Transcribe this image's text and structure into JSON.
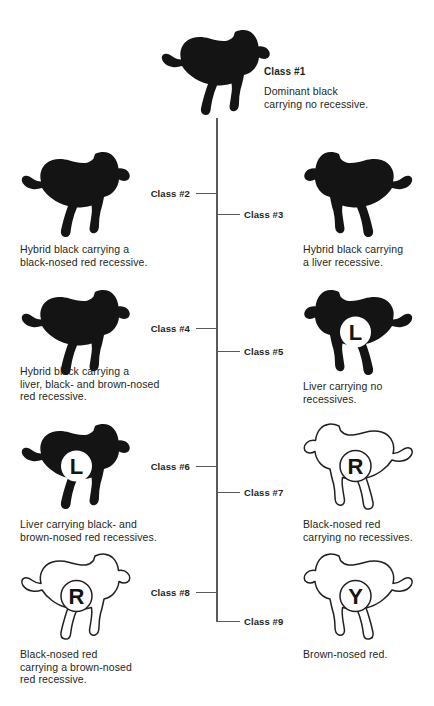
{
  "diagram": {
    "line_color": "#58595b",
    "silhouette_color": "#141414",
    "outline_color": "#231f20",
    "text_color": "#231f20"
  },
  "nodes": [
    {
      "id": "class1",
      "label": "Class #1",
      "caption": "Dominant black carrying no recessive.",
      "caption_lines": [
        "Dominant black",
        "carrying no recessive."
      ],
      "dog_style": "filled",
      "dog_facing": "right",
      "badge": null
    },
    {
      "id": "class2",
      "label": "Class #2",
      "caption": "Hybrid black carrying a black-nosed red recessive.",
      "caption_lines": [
        "Hybrid black carrying a",
        "black-nosed red recessive."
      ],
      "dog_style": "filled",
      "dog_facing": "right",
      "badge": null
    },
    {
      "id": "class3",
      "label": "Class #3",
      "caption": "Hybrid black carrying a liver recessive.",
      "caption_lines": [
        "Hybrid black carrying",
        "a liver recessive."
      ],
      "dog_style": "filled",
      "dog_facing": "left",
      "badge": null
    },
    {
      "id": "class4",
      "label": "Class #4",
      "caption": "Hybrid black carrying a liver, black- and brown-nosed red recessive.",
      "caption_lines": [
        "Hybrid black carrying a",
        "liver, black- and brown-nosed",
        "red recessive."
      ],
      "dog_style": "filled",
      "dog_facing": "right",
      "badge": null
    },
    {
      "id": "class5",
      "label": "Class #5",
      "caption": "Liver carrying no recessives.",
      "caption_lines": [
        "Liver carrying no",
        "recessives."
      ],
      "dog_style": "filled",
      "dog_facing": "left",
      "badge": "L"
    },
    {
      "id": "class6",
      "label": "Class #6",
      "caption": "Liver carrying black- and brown-nosed red recessives.",
      "caption_lines": [
        "Liver carrying black- and",
        "brown-nosed red recessives."
      ],
      "dog_style": "filled",
      "dog_facing": "right",
      "badge": "L"
    },
    {
      "id": "class7",
      "label": "Class #7",
      "caption": "Black-nosed red carrying no recessives.",
      "caption_lines": [
        "Black-nosed red",
        "carrying no recessives."
      ],
      "dog_style": "outline",
      "dog_facing": "left",
      "badge": "R"
    },
    {
      "id": "class8",
      "label": "Class #8",
      "caption": "Black-nosed red carrying a brown-nosed red recessive.",
      "caption_lines": [
        "Black-nosed red",
        "carrying a brown-nosed",
        "red recessive."
      ],
      "dog_style": "outline",
      "dog_facing": "right",
      "badge": "R"
    },
    {
      "id": "class9",
      "label": "Class #9",
      "caption": "Brown-nosed red.",
      "caption_lines": [
        "Brown-nosed red."
      ],
      "dog_style": "outline",
      "dog_facing": "left",
      "badge": "Y"
    }
  ]
}
